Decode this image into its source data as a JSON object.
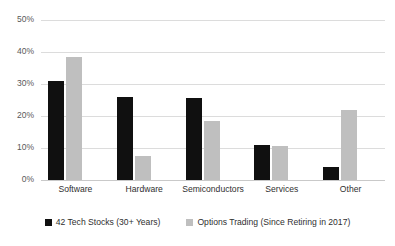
{
  "chart_data": {
    "type": "bar",
    "title": "",
    "xlabel": "",
    "ylabel": "",
    "ylim": [
      0,
      50
    ],
    "ytick_labels": [
      "50%",
      "40%",
      "30%",
      "20%",
      "10%",
      "0%"
    ],
    "ytick_values": [
      50,
      40,
      30,
      20,
      10,
      0
    ],
    "grid": true,
    "legend_position": "bottom",
    "categories": [
      "Software",
      "Hardware",
      "Semiconductors",
      "Services",
      "Other"
    ],
    "series": [
      {
        "name": "42 Tech Stocks (30+ Years)",
        "color": "#101010",
        "values": [
          31,
          26,
          25.5,
          11,
          4
        ]
      },
      {
        "name": "Options Trading (Since Retiring in 2017)",
        "color": "#bfbfbf",
        "values": [
          38.5,
          7.5,
          18.5,
          10.5,
          22
        ]
      }
    ]
  }
}
